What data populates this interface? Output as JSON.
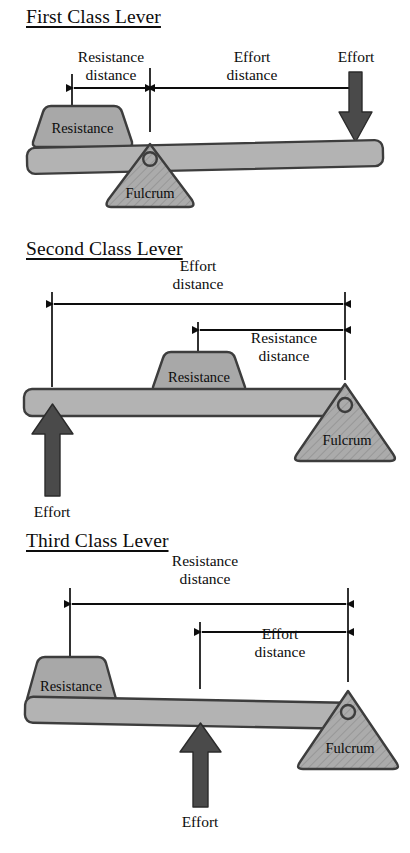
{
  "diagram": {
    "title_style": "underlined-serif",
    "colors": {
      "beam_fill": "#b3b3b3",
      "beam_stroke": "#3d3d3d",
      "block_fill": "#a8a8a8",
      "block_stroke": "#3d3d3d",
      "fulcrum_fill": "#ababab",
      "fulcrum_stroke": "#3d3d3d",
      "fulcrum_hatch": "#8f8f8f",
      "arrow_fill": "#4a4a4a",
      "arrow_stroke": "#2b2b2b",
      "dimension_line": "#0d0d0d",
      "text": "#0d0d0d",
      "background": "#ffffff"
    },
    "sections": [
      {
        "id": "first-class-lever",
        "title": "First Class Lever",
        "fulcrum_label": "Fulcrum",
        "resistance_label": "Resistance",
        "effort_label": "Effort",
        "dimensions": [
          {
            "id": "resistance-distance",
            "line1": "Resistance",
            "line2": "distance"
          },
          {
            "id": "effort-distance",
            "line1": "Effort",
            "line2": "distance"
          }
        ],
        "order": "Resistance - Fulcrum - Effort",
        "effort_direction": "down",
        "fulcrum_position": "middle"
      },
      {
        "id": "second-class-lever",
        "title": "Second Class Lever",
        "fulcrum_label": "Fulcrum",
        "resistance_label": "Resistance",
        "effort_label": "Effort",
        "dimensions": [
          {
            "id": "effort-distance",
            "line1": "Effort",
            "line2": "distance"
          },
          {
            "id": "resistance-distance",
            "line1": "Resistance",
            "line2": "distance"
          }
        ],
        "order": "Effort - Resistance - Fulcrum",
        "effort_direction": "up",
        "fulcrum_position": "right-end"
      },
      {
        "id": "third-class-lever",
        "title": "Third Class Lever",
        "fulcrum_label": "Fulcrum",
        "resistance_label": "Resistance",
        "effort_label": "Effort",
        "dimensions": [
          {
            "id": "resistance-distance",
            "line1": "Resistance",
            "line2": "distance"
          },
          {
            "id": "effort-distance",
            "line1": "Effort",
            "line2": "distance"
          }
        ],
        "order": "Resistance - Effort - Fulcrum",
        "effort_direction": "up",
        "fulcrum_position": "right-end"
      }
    ]
  }
}
